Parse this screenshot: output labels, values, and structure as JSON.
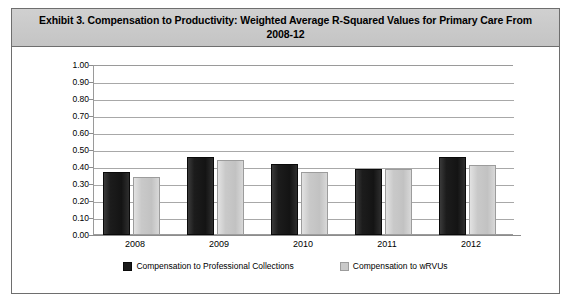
{
  "figure": {
    "title": "Exhibit 3. Compensation to Productivity: Weighted Average R-Squared Values for Primary Care From 2008-12"
  },
  "chart_data": {
    "type": "bar",
    "title": "Exhibit 3. Compensation to Productivity: Weighted Average R-Squared Values for Primary Care From 2008-12",
    "xlabel": "",
    "ylabel": "",
    "categories": [
      "2008",
      "2009",
      "2010",
      "2011",
      "2012"
    ],
    "series": [
      {
        "name": "Compensation to Professional Collections",
        "color": "#1a1a1a",
        "values": [
          0.37,
          0.46,
          0.42,
          0.39,
          0.46
        ]
      },
      {
        "name": "Compensation to wRVUs",
        "color": "#c9c9c9",
        "values": [
          0.34,
          0.44,
          0.37,
          0.39,
          0.41
        ]
      }
    ],
    "ylim": [
      0.0,
      1.0
    ],
    "ytick_labels": [
      "1.00",
      "0.90",
      "0.80",
      "0.70",
      "0.60",
      "0.50",
      "0.40",
      "0.30",
      "0.20",
      "0.10",
      "0.00"
    ],
    "ytick_values": [
      1.0,
      0.9,
      0.8,
      0.7,
      0.6,
      0.5,
      0.4,
      0.3,
      0.2,
      0.1,
      0.0
    ],
    "grid": true,
    "legend_position": "bottom"
  },
  "legend": {
    "items": [
      {
        "label": "Compensation to Professional Collections",
        "swatch": "dark"
      },
      {
        "label": "Compensation to wRVUs",
        "swatch": "light"
      }
    ]
  }
}
